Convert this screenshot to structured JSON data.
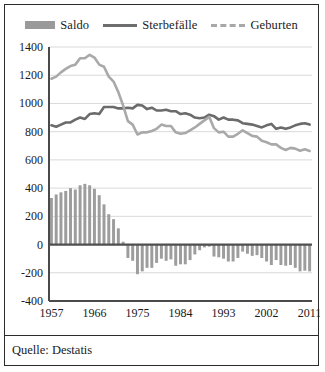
{
  "legend": {
    "items": [
      {
        "label": "Saldo",
        "marker": "filled-bar-swatch",
        "color": "#9a9a9a"
      },
      {
        "label": "Sterbefälle",
        "marker": "solid-line-swatch",
        "color": "#6d6d6d"
      },
      {
        "label": "Geburten",
        "marker": "dashed-line-swatch",
        "color": "#a8a8a8"
      }
    ]
  },
  "source": {
    "text": "Quelle: Destatis"
  },
  "chart_data": {
    "type": "bar",
    "title": "",
    "subtitle": "",
    "xlabel": "",
    "ylabel": "",
    "ylim": [
      -400,
      1400
    ],
    "ytick_step": 200,
    "yticks": [
      1400,
      1200,
      1000,
      800,
      600,
      400,
      200,
      0,
      -200,
      -400
    ],
    "grid": true,
    "legend_position": "top",
    "x": [
      1957,
      1958,
      1959,
      1960,
      1961,
      1962,
      1963,
      1964,
      1965,
      1966,
      1967,
      1968,
      1969,
      1970,
      1971,
      1972,
      1973,
      1974,
      1975,
      1976,
      1977,
      1978,
      1979,
      1980,
      1981,
      1982,
      1983,
      1984,
      1985,
      1986,
      1987,
      1988,
      1989,
      1990,
      1991,
      1992,
      1993,
      1994,
      1995,
      1996,
      1997,
      1998,
      1999,
      2000,
      2001,
      2002,
      2003,
      2004,
      2005,
      2006,
      2007,
      2008,
      2009,
      2010,
      2011
    ],
    "xticks": [
      1957,
      1966,
      1975,
      1984,
      1993,
      2002,
      2011
    ],
    "xtick_labels": [
      "1957",
      "1966",
      "1975",
      "1984",
      "1993",
      "2002",
      "2011"
    ],
    "series": [
      {
        "name": "Saldo",
        "type": "bar",
        "color": "#9d9d9d",
        "values": [
          330,
          355,
          370,
          380,
          400,
          390,
          420,
          430,
          420,
          395,
          350,
          285,
          215,
          180,
          115,
          20,
          -95,
          -115,
          -210,
          -190,
          -165,
          -165,
          -130,
          -100,
          -115,
          -105,
          -150,
          -140,
          -140,
          -110,
          -70,
          -40,
          -20,
          -15,
          -85,
          -90,
          -100,
          -120,
          -120,
          -95,
          -50,
          -65,
          -80,
          -75,
          -95,
          -120,
          -145,
          -110,
          -145,
          -150,
          -145,
          -165,
          -190,
          -185,
          -190
        ]
      },
      {
        "name": "Sterbefälle",
        "type": "line",
        "style": "solid",
        "color": "#6b6b6b",
        "values": [
          845,
          835,
          850,
          865,
          865,
          885,
          900,
          890,
          925,
          930,
          925,
          975,
          975,
          975,
          965,
          965,
          970,
          965,
          990,
          985,
          960,
          970,
          950,
          950,
          955,
          945,
          945,
          925,
          930,
          920,
          900,
          895,
          900,
          920,
          910,
          885,
          900,
          885,
          885,
          880,
          860,
          855,
          850,
          840,
          830,
          845,
          855,
          820,
          830,
          820,
          830,
          845,
          855,
          860,
          850
        ]
      },
      {
        "name": "Geburten",
        "type": "line",
        "style": "dashed",
        "color": "#a9a9a9",
        "values": [
          1175,
          1190,
          1220,
          1245,
          1265,
          1275,
          1320,
          1320,
          1345,
          1325,
          1275,
          1260,
          1190,
          1155,
          1080,
          985,
          875,
          850,
          780,
          795,
          795,
          805,
          820,
          850,
          840,
          840,
          795,
          785,
          790,
          810,
          830,
          855,
          880,
          905,
          825,
          795,
          800,
          765,
          765,
          785,
          810,
          790,
          770,
          765,
          735,
          725,
          710,
          710,
          685,
          670,
          685,
          680,
          665,
          675,
          663
        ]
      }
    ]
  }
}
